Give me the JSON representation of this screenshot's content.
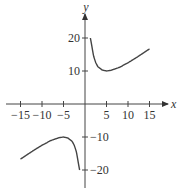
{
  "chart_data": {
    "type": "line",
    "title": "",
    "xlabel": "x",
    "ylabel": "y",
    "xlim": [
      -17,
      18
    ],
    "ylim": [
      -22,
      24
    ],
    "grid": false,
    "x_ticks": [
      -15,
      -10,
      -5,
      5,
      10,
      15
    ],
    "x_tick_labels": [
      "−15",
      "−10",
      "−5",
      "5",
      "10",
      "15"
    ],
    "y_ticks": [
      20,
      10,
      -10,
      -20
    ],
    "y_tick_labels": [
      "20",
      "10",
      "−10",
      "−20"
    ],
    "series": [
      {
        "name": "right-branch",
        "x": [
          1.25,
          1.5,
          2,
          2.5,
          3,
          4,
          5,
          6,
          8,
          10,
          12,
          15
        ],
        "y": [
          20,
          18.2,
          14.5,
          12.5,
          11.3,
          10.3,
          10,
          10.2,
          11.1,
          12.5,
          14.1,
          16.7
        ]
      },
      {
        "name": "left-branch",
        "x": [
          -15,
          -12,
          -10,
          -8,
          -6,
          -5,
          -4,
          -3,
          -2.5,
          -2,
          -1.5,
          -1.25
        ],
        "y": [
          -16.7,
          -14.1,
          -12.5,
          -11.1,
          -10.2,
          -10,
          -10.3,
          -11.3,
          -12.5,
          -14.5,
          -18.2,
          -20
        ]
      }
    ]
  }
}
